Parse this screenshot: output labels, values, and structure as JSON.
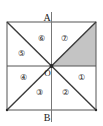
{
  "figure": {
    "type": "geometry-diagram",
    "top_partial_text": "",
    "axis_labels": {
      "top": "A",
      "bottom": "B",
      "origin": "O"
    },
    "sectors": [
      {
        "id": "sector-1",
        "label": "①",
        "position": "right-lower",
        "shaded": false
      },
      {
        "id": "sector-2",
        "label": "②",
        "position": "bottom-right",
        "shaded": false
      },
      {
        "id": "sector-3",
        "label": "③",
        "position": "bottom-left",
        "shaded": false
      },
      {
        "id": "sector-4",
        "label": "④",
        "position": "left-lower",
        "shaded": false
      },
      {
        "id": "sector-5",
        "label": "⑤",
        "position": "left-upper",
        "shaded": false
      },
      {
        "id": "sector-6",
        "label": "⑥",
        "position": "top-left",
        "shaded": false
      },
      {
        "id": "sector-7",
        "label": "⑦",
        "position": "top-right",
        "shaded": false
      },
      {
        "id": "sector-8",
        "label": "",
        "position": "right-upper",
        "shaded": true
      }
    ],
    "colors": {
      "stroke": "#333333",
      "shade_fill": "#c4c4c4",
      "background": "#ffffff",
      "thin_stroke": "#8a8a8a"
    }
  }
}
